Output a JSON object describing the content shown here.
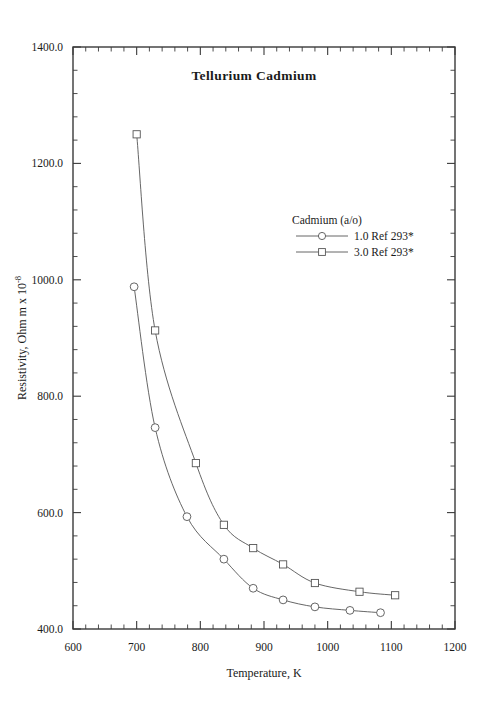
{
  "chart_data": {
    "type": "line",
    "title": "Tellurium  Cadmium",
    "xlabel": "Temperature,  K",
    "ylabel": "Resistivity, Ohm m x 10",
    "ylabel_exponent": "-8",
    "xlim": [
      600,
      1200
    ],
    "ylim": [
      400,
      1400
    ],
    "xticks": [
      "600",
      "700",
      "800",
      "900",
      "1000",
      "1100",
      "1200"
    ],
    "xtick_values": [
      600,
      700,
      800,
      900,
      1000,
      1100,
      1200
    ],
    "yticks": [
      "400.0",
      "600.0",
      "800.0",
      "1000.0",
      "1200.0",
      "1400.0"
    ],
    "ytick_values": [
      400,
      600,
      800,
      1000,
      1200,
      1400
    ],
    "minor_ticks_per_interval": 5,
    "grid": false,
    "legend_position": "upper-right-inside",
    "legend_title": "Cadmium (a/o)",
    "series": [
      {
        "name": "1.0 Ref 293*",
        "marker": "circle",
        "color": "#555555",
        "x": [
          696,
          729,
          779,
          837,
          883,
          930,
          980,
          1035,
          1083
        ],
        "values": [
          988,
          746,
          593,
          520,
          470,
          450,
          438,
          432,
          428
        ]
      },
      {
        "name": "3.0 Ref 293*",
        "marker": "square",
        "color": "#555555",
        "x": [
          700,
          729,
          793,
          837,
          883,
          930,
          980,
          1050,
          1106
        ],
        "values": [
          1250,
          913,
          685,
          579,
          539,
          511,
          479,
          464,
          458
        ]
      }
    ]
  },
  "figure": {
    "background": "#ffffff",
    "axis_color": "#3a3a3a",
    "text_color": "#1a1a1a"
  }
}
